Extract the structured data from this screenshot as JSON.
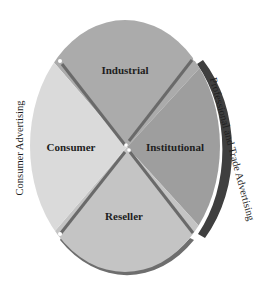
{
  "diagram": {
    "segments": [
      {
        "id": "industrial",
        "label": "Industrial",
        "color": "#ababab"
      },
      {
        "id": "institutional",
        "label": "Institutional",
        "color": "#9e9e9e"
      },
      {
        "id": "reseller",
        "label": "Reseller",
        "color": "#c4c4c4"
      },
      {
        "id": "consumer",
        "label": "Consumer",
        "color": "#dadada"
      }
    ],
    "side_labels": {
      "left": "Consumer Advertising",
      "right": "Professional and Trade Advertising"
    },
    "colors": {
      "divider": "#6a6a6a",
      "shadow": "#4a4a4a",
      "shadow_light": "#7a7a7a"
    }
  }
}
